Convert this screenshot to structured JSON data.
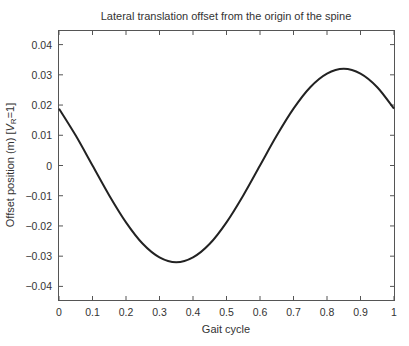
{
  "chart_data": {
    "type": "line",
    "title": "Lateral translation offset from the origin of the spine",
    "xlabel": "Gait cycle",
    "ylabel_main": "Offset position (m) [",
    "ylabel_var": "V",
    "ylabel_sub": "R",
    "ylabel_tail": "=1]",
    "xlim": [
      0,
      1
    ],
    "ylim": [
      -0.0445,
      0.0445
    ],
    "grid": false,
    "legend": null,
    "x_ticks": [
      0,
      0.1,
      0.2,
      0.3,
      0.4,
      0.5,
      0.6,
      0.7,
      0.8,
      0.9,
      1
    ],
    "x_tick_labels": [
      "0",
      "0.1",
      "0.2",
      "0.3",
      "0.4",
      "0.5",
      "0.6",
      "0.7",
      "0.8",
      "0.9",
      "1"
    ],
    "y_ticks": [
      0.04,
      0.03,
      0.02,
      0.01,
      0,
      -0.01,
      -0.02,
      -0.03,
      -0.04
    ],
    "y_tick_labels": [
      "0.04",
      "0.03",
      "0.02",
      "0.01",
      "0",
      "−0.01",
      "−0.02",
      "−0.03",
      "−0.04"
    ],
    "series": [
      {
        "name": "Lateral offset",
        "color": "#222222",
        "x": [
          0,
          0.05,
          0.1,
          0.15,
          0.2,
          0.25,
          0.3,
          0.35,
          0.4,
          0.45,
          0.5,
          0.55,
          0.6,
          0.65,
          0.7,
          0.75,
          0.8,
          0.85,
          0.9,
          0.95,
          1.0
        ],
        "y": [
          0.0188,
          0.0099,
          0.0,
          -0.0099,
          -0.0188,
          -0.0259,
          -0.0304,
          -0.032,
          -0.0304,
          -0.0259,
          -0.0188,
          -0.0099,
          0.0,
          0.0099,
          0.0188,
          0.0259,
          0.0304,
          0.032,
          0.0304,
          0.0259,
          0.0188
        ]
      }
    ],
    "annotations": {
      "peak": {
        "x": 0.85,
        "y": 0.032
      },
      "trough": {
        "x": 0.35,
        "y": -0.032
      }
    }
  },
  "style": {
    "axis_color": "#555555",
    "line_color": "#222222",
    "text_color": "#333333"
  }
}
